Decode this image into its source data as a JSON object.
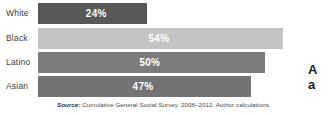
{
  "chart_data": {
    "type": "bar",
    "orientation": "horizontal",
    "title": "",
    "subtitle": "",
    "xlabel": "",
    "ylabel": "",
    "categories": [
      "White",
      "Black",
      "Latino",
      "Asian"
    ],
    "values": [
      24,
      50,
      47,
      54
    ],
    "value_labels": [
      "24%",
      "54%",
      "50%",
      "47%"
    ],
    "bars": [
      {
        "category": "White",
        "value": 24,
        "label": "24%",
        "color": "#585858"
      },
      {
        "category": "Black",
        "value": 54,
        "label": "54%",
        "color": "#c4c4c4"
      },
      {
        "category": "Latino",
        "value": 50,
        "label": "50%",
        "color": "#7b7b7b"
      },
      {
        "category": "Asian",
        "value": 47,
        "label": "47%",
        "color": "#737373"
      }
    ],
    "xlim": [
      0,
      55
    ],
    "grid": false,
    "legend": null,
    "annotations": []
  },
  "source": {
    "prefix": "Source:",
    "text": "Cumulative General Social Survey, 2008–2012. Author calculations."
  },
  "side_caption": {
    "line1": "A",
    "line2": "a"
  }
}
